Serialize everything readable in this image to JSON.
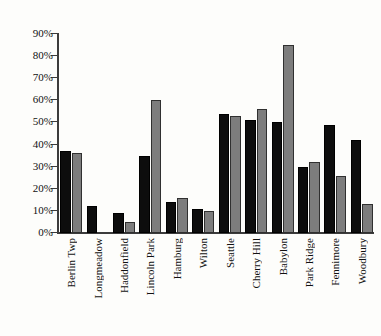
{
  "chart_data": {
    "type": "bar",
    "title": "",
    "xlabel": "",
    "ylabel": "",
    "ylim": [
      0,
      90
    ],
    "ytick_labels": [
      "0%",
      "10%",
      "20%",
      "30%",
      "40%",
      "50%",
      "60%",
      "70%",
      "80%",
      "90%"
    ],
    "ytick_values": [
      0,
      10,
      20,
      30,
      40,
      50,
      60,
      70,
      80,
      90
    ],
    "grid": false,
    "legend": "none",
    "categories": [
      "Berlin Twp",
      "Longmeadow",
      "Haddonfield",
      "Lincoln Park",
      "Hamburg",
      "Wilton",
      "Seattle",
      "Cherry Hill",
      "Babylon",
      "Park Ridge",
      "Fennimore",
      "Woodbury"
    ],
    "series": [
      {
        "name": "black",
        "color": "#0d0d0d",
        "values": [
          37,
          12,
          9,
          35,
          14,
          11,
          54,
          51,
          50,
          30,
          49,
          42
        ]
      },
      {
        "name": "gray",
        "color": "#7d7d7d",
        "values": [
          36,
          null,
          5,
          60,
          16,
          10,
          53,
          56,
          85,
          32,
          26,
          13
        ]
      }
    ]
  }
}
